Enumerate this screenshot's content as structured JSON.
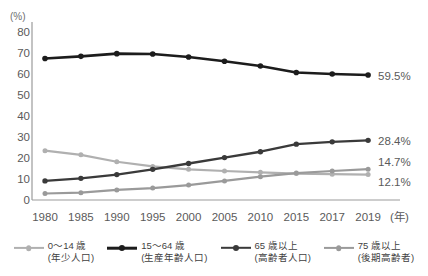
{
  "chart_data": {
    "type": "line",
    "title": "",
    "xlabel": "(年)",
    "ylabel": "(%)",
    "ylim": [
      0,
      80
    ],
    "yticks": [
      0,
      10,
      20,
      30,
      40,
      50,
      60,
      70,
      80
    ],
    "grid": false,
    "legend_position": "bottom",
    "categories": [
      "1980",
      "1985",
      "1990",
      "1995",
      "2000",
      "2005",
      "2010",
      "2015",
      "2017",
      "2019"
    ],
    "series": [
      {
        "name": "0〜14 歳",
        "sublabel": "(年少人口)",
        "color": "#b0b0b0",
        "line_width": 2.2,
        "marker_size": 5.0,
        "end_label": "12.1%",
        "values": [
          23.5,
          21.5,
          18.2,
          16.0,
          14.6,
          13.8,
          13.2,
          12.6,
          12.3,
          12.1
        ]
      },
      {
        "name": "15〜64 歳",
        "sublabel": "(生産年齢人口)",
        "color": "#1c1c1c",
        "line_width": 2.6,
        "marker_size": 5.6,
        "end_label": "59.5%",
        "values": [
          67.4,
          68.4,
          69.7,
          69.5,
          68.1,
          66.1,
          63.8,
          60.7,
          60.0,
          59.5
        ]
      },
      {
        "name": "65 歳以上",
        "sublabel": "(高齢者人口)",
        "color": "#3a3a3a",
        "line_width": 2.4,
        "marker_size": 5.4,
        "end_label": "28.4%",
        "values": [
          9.1,
          10.3,
          12.1,
          14.6,
          17.4,
          20.2,
          23.0,
          26.6,
          27.7,
          28.4
        ]
      },
      {
        "name": "75 歳以上",
        "sublabel": "(後期高齢者)",
        "color": "#9a9a9a",
        "line_width": 2.2,
        "marker_size": 5.0,
        "end_label": "14.7%",
        "values": [
          3.1,
          3.5,
          4.8,
          5.7,
          7.1,
          9.1,
          11.1,
          12.8,
          13.8,
          14.7
        ]
      }
    ]
  },
  "axis": {
    "unit_top": "(%)",
    "unit_right": "(年)"
  },
  "colors": {
    "axis_line": "#9b9b9b",
    "tick_text": "#5a5a5a",
    "background": "#ffffff"
  }
}
